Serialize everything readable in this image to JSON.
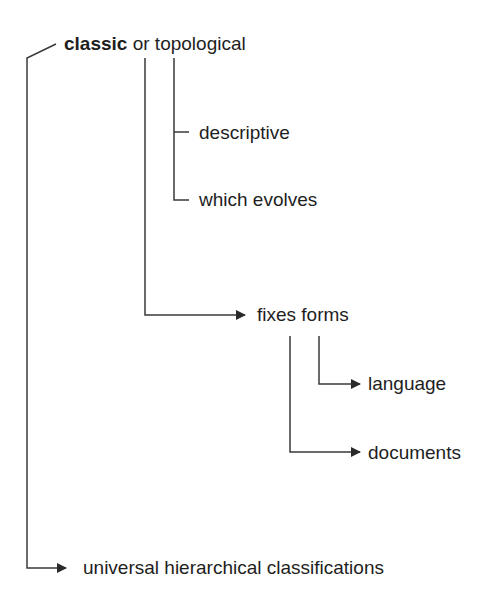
{
  "diagram": {
    "type": "tree",
    "root": {
      "bold_term": "classic",
      "rest": " or topological"
    },
    "nodes": [
      {
        "id": "descriptive",
        "label": "descriptive",
        "parent": "topological",
        "connector": "tick"
      },
      {
        "id": "which-evolves",
        "label": "which evolves",
        "parent": "topological",
        "connector": "tick"
      },
      {
        "id": "fixes-forms",
        "label": "fixes forms",
        "parent": "classic",
        "connector": "arrow"
      },
      {
        "id": "language",
        "label": "language",
        "parent": "fixes-forms",
        "connector": "arrow"
      },
      {
        "id": "documents",
        "label": "documents",
        "parent": "fixes-forms",
        "connector": "arrow"
      },
      {
        "id": "universal",
        "label": "universal hierarchical classifications",
        "parent": "root",
        "connector": "arrow"
      }
    ],
    "colors": {
      "line": "#3a3a3a",
      "text": "#1e1e1e",
      "background": "#ffffff"
    }
  }
}
